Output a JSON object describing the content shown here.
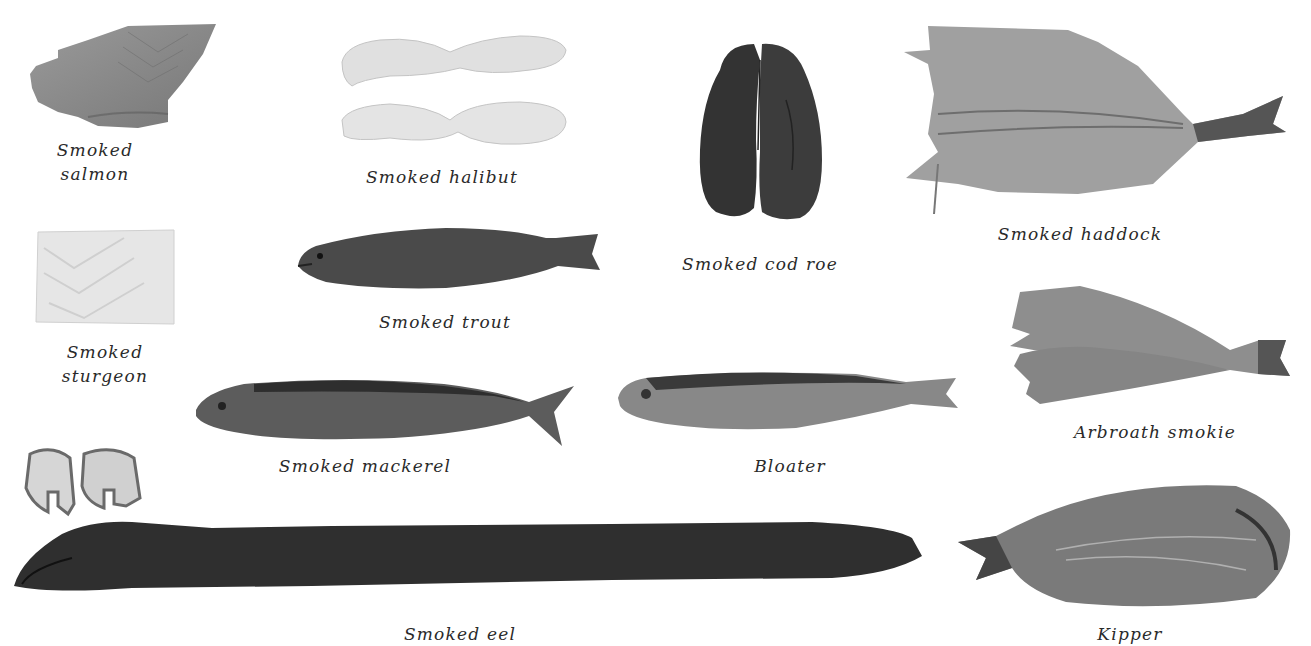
{
  "background": "#ffffff",
  "items": [
    {
      "id": "smoked-salmon",
      "caption_lines": [
        "Smoked",
        "salmon"
      ],
      "tone": "#8a8a8a"
    },
    {
      "id": "smoked-halibut",
      "caption_lines": [
        "Smoked halibut"
      ],
      "tone": "#dcdcdc"
    },
    {
      "id": "smoked-cod-roe",
      "caption_lines": [
        "Smoked cod roe"
      ],
      "tone": "#3a3a3a"
    },
    {
      "id": "smoked-haddock",
      "caption_lines": [
        "Smoked haddock"
      ],
      "tone": "#9a9a9a"
    },
    {
      "id": "smoked-sturgeon",
      "caption_lines": [
        "Smoked",
        "sturgeon"
      ],
      "tone": "#e2e2e2"
    },
    {
      "id": "smoked-trout",
      "caption_lines": [
        "Smoked trout"
      ],
      "tone": "#4a4a4a"
    },
    {
      "id": "arbroath-smokie",
      "caption_lines": [
        "Arbroath smokie"
      ],
      "tone": "#8c8c8c"
    },
    {
      "id": "smoked-mackerel",
      "caption_lines": [
        "Smoked mackerel"
      ],
      "tone": "#5a5a5a"
    },
    {
      "id": "bloater",
      "caption_lines": [
        "Bloater"
      ],
      "tone": "#7a7a7a"
    },
    {
      "id": "smoked-eel",
      "caption_lines": [
        "Smoked eel"
      ],
      "tone": "#2e2e2e"
    },
    {
      "id": "kipper",
      "caption_lines": [
        "Kipper"
      ],
      "tone": "#707070"
    }
  ]
}
